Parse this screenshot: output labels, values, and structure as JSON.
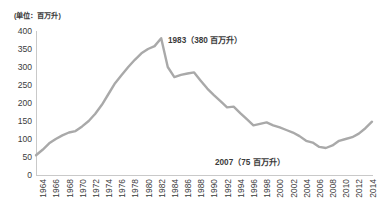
{
  "unit_label": "(单位：百万升)",
  "chart_data": {
    "type": "line",
    "title": "",
    "subtitle": "",
    "xlabel": "",
    "ylabel": "",
    "unit": "百万升",
    "unit_label": "(单位：百万升)",
    "grid": false,
    "legend": "none",
    "ylim": [
      0,
      400
    ],
    "yticks": [
      400,
      350,
      300,
      250,
      200,
      150,
      100,
      50,
      0
    ],
    "ytick_labels": [
      "400",
      "350",
      "300",
      "250",
      "200",
      "150",
      "100",
      "50",
      "0"
    ],
    "xlim": [
      1964,
      2015
    ],
    "xticks": [
      1964,
      1966,
      1968,
      1970,
      1972,
      1974,
      1976,
      1978,
      1980,
      1982,
      1984,
      1986,
      1988,
      1990,
      1992,
      1994,
      1996,
      1998,
      2000,
      2002,
      2004,
      2006,
      2008,
      2010,
      2012,
      2014
    ],
    "xtick_labels": [
      "1964",
      "1966",
      "1968",
      "1970",
      "1972",
      "1974",
      "1976",
      "1978",
      "1980",
      "1982",
      "1984",
      "1986",
      "1988",
      "1990",
      "1992",
      "1994",
      "1996",
      "1998",
      "2000",
      "2002",
      "2004",
      "2006",
      "2008",
      "2010",
      "2012",
      "2014"
    ],
    "line_color": "#a9a9a9",
    "axis_color": "#c9c9c9",
    "x": [
      1964,
      1965,
      1966,
      1967,
      1968,
      1969,
      1970,
      1971,
      1972,
      1973,
      1974,
      1975,
      1976,
      1977,
      1978,
      1979,
      1980,
      1981,
      1982,
      1983,
      1984,
      1985,
      1986,
      1987,
      1988,
      1989,
      1990,
      1991,
      1992,
      1993,
      1994,
      1995,
      1996,
      1997,
      1998,
      1999,
      2000,
      2001,
      2002,
      2003,
      2004,
      2005,
      2006,
      2007,
      2008,
      2009,
      2010,
      2011,
      2012,
      2013,
      2014,
      2015
    ],
    "values": [
      55,
      70,
      88,
      100,
      110,
      118,
      122,
      135,
      150,
      170,
      195,
      225,
      255,
      278,
      300,
      320,
      338,
      350,
      358,
      380,
      300,
      272,
      278,
      282,
      285,
      262,
      240,
      222,
      205,
      188,
      190,
      172,
      155,
      138,
      142,
      146,
      138,
      132,
      125,
      118,
      108,
      95,
      90,
      78,
      75,
      82,
      95,
      100,
      105,
      115,
      130,
      148
    ],
    "annotations": [
      {
        "name": "peak",
        "text": "1983（380 百万升）",
        "year": 1983,
        "value": 380
      },
      {
        "name": "trough",
        "text": "2007（75 百万升）",
        "year": 2007,
        "value": 75
      }
    ]
  }
}
